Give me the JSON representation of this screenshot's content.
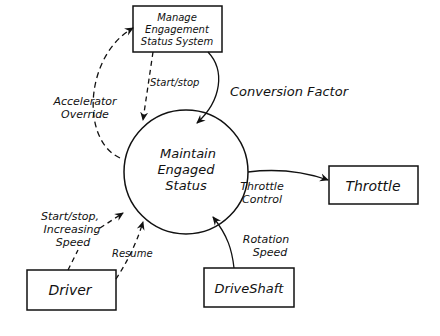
{
  "diagram": {
    "type": "data-flow-diagram",
    "process": {
      "line1": "Maintain",
      "line2": "Engaged",
      "line3": "Status"
    },
    "entities": {
      "manage": {
        "line1": "Manage",
        "line2": "Engagement",
        "line3": "Status System"
      },
      "throttle": {
        "label": "Throttle"
      },
      "driver": {
        "label": "Driver"
      },
      "driveshaft": {
        "label": "DriveShaft"
      }
    },
    "flows": {
      "start_stop": {
        "label": "Start/stop"
      },
      "conversion_factor": {
        "label": "Conversion Factor"
      },
      "accelerator_override": {
        "line1": "Accelerator",
        "line2": "Override"
      },
      "throttle_control": {
        "line1": "Throttle",
        "line2": "Control"
      },
      "driver_start_stop": {
        "line1": "Start/stop,",
        "line2": "Increasing",
        "line3": "Speed"
      },
      "resume": {
        "label": "Resume"
      },
      "rotation_speed": {
        "line1": "Rotation",
        "line2": "Speed"
      }
    }
  }
}
